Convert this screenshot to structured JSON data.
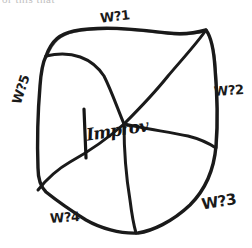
{
  "page": {
    "cut_off_top_text": "or this that",
    "background_color": "#ffffff",
    "ink_color": "#1a1a1a"
  },
  "diagram": {
    "title": "Improv",
    "type": "hand-drawn sectioned blob",
    "center_label": "Improv",
    "sector_count": 5,
    "labels": [
      {
        "id": "w1",
        "text": "W?1",
        "position": "top"
      },
      {
        "id": "w2",
        "text": "W?2",
        "position": "right"
      },
      {
        "id": "w3",
        "text": "W?3",
        "position": "bottom-right"
      },
      {
        "id": "w4",
        "text": "W?4",
        "position": "bottom-left"
      },
      {
        "id": "w5",
        "text": "W?5",
        "position": "left"
      }
    ],
    "shapes": {
      "outline_path": "M 46,56 C 52,40 60,34 74,31 C 104,25 140,30 168,33 C 185,35 199,32 206,30 C 212,38 214,52 215,68 C 217,92 218,120 216,146 C 214,170 205,190 190,205 C 172,222 152,231 138,233 C 120,234 100,228 86,220 C 70,210 56,200 46,192 C 40,186 38,178 38,168 C 37,140 38,110 40,86 C 41,72 43,62 46,56 Z",
      "spokes": [
        "M 124,124 C 118,110 112,92 104,76 C 92,58 72,50 46,56",
        "M 124,124 C 136,112 152,96 168,76 C 185,56 198,42 206,30",
        "M 124,124 C 142,128 168,132 188,136 C 200,139 210,144 216,148",
        "M 124,124 C 124,146 126,176 130,200 C 132,216 134,226 136,233",
        "M 124,124 C 106,140 88,152 70,162 C 56,170 46,180 38,190"
      ]
    }
  }
}
